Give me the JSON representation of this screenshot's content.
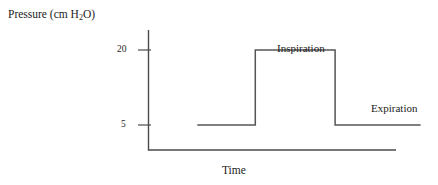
{
  "figure": {
    "background_color": "#ffffff",
    "line_color": "#555555",
    "axis_color": "#4a4a4a",
    "text_color": "#1c1c1c"
  },
  "axis": {
    "y_title_prefix": "Pressure (cm H",
    "y_title_sub": "2",
    "y_title_suffix": "O)",
    "y_title_full": "Pressure (cm H2O)",
    "x_title": "Time",
    "tick_labels": [
      "20",
      "5"
    ],
    "tick_20": "20",
    "tick_5": "5"
  },
  "annotations": {
    "inspiration": "Inspiration",
    "expiration": "Expiration"
  },
  "chart_data": {
    "type": "line",
    "title": "",
    "subtitle": "",
    "xlabel": "Time",
    "ylabel": "Pressure (cm H2O)",
    "grid": false,
    "legend": "none",
    "x_tick_labels": [],
    "y_tick_labels": [
      "5",
      "20"
    ],
    "y_tick_values": [
      5,
      20
    ],
    "ylim": [
      0,
      24
    ],
    "xlim": [
      0,
      10
    ],
    "series": [
      {
        "name": "Airway pressure",
        "waveform": "square",
        "baseline_value": 5,
        "peak_value": 20,
        "x": [
          1.7,
          3.7,
          3.7,
          6.45,
          6.45,
          9.4
        ],
        "y": [
          5,
          5,
          20,
          20,
          5,
          5
        ],
        "points": [
          {
            "x": 1.7,
            "y": 5,
            "note": "expiratory baseline (PEEP) start"
          },
          {
            "x": 3.7,
            "y": 5,
            "note": "end of baseline"
          },
          {
            "x": 3.7,
            "y": 20,
            "note": "rise to peak inspiratory pressure"
          },
          {
            "x": 6.45,
            "y": 20,
            "note": "inspiratory plateau"
          },
          {
            "x": 6.45,
            "y": 5,
            "note": "drop back to baseline"
          },
          {
            "x": 9.4,
            "y": 5,
            "note": "expiratory baseline continues"
          }
        ]
      }
    ],
    "annotations": [
      {
        "text": "Inspiration",
        "x": 5.1,
        "y": 22.5
      },
      {
        "text": "Expiration",
        "x": 8.4,
        "y": 12.0
      }
    ]
  }
}
